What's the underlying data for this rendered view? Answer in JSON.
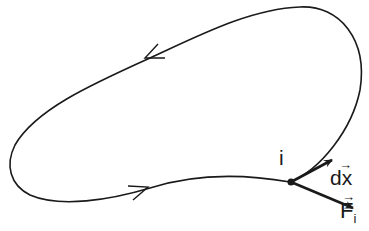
{
  "diagram": {
    "type": "closed path with point and vectors",
    "curve": {
      "stroke": "#1a1a1a",
      "direction": "counterclockwise"
    },
    "point": {
      "label": "i"
    },
    "vectors": [
      {
        "label": "dx",
        "arrow": "→",
        "description": "displacement vector at point i"
      },
      {
        "label": "F",
        "subscript": "i",
        "arrow": "→",
        "description": "force vector at point i"
      }
    ]
  }
}
